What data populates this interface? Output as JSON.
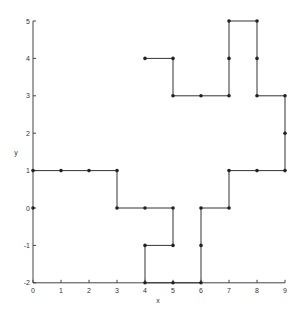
{
  "chart_data": {
    "type": "line",
    "title": "",
    "xlabel": "x",
    "ylabel": "y",
    "xlim": [
      0,
      9
    ],
    "ylim": [
      -2,
      5
    ],
    "grid": false,
    "legend": null,
    "x_ticks": [
      0,
      1,
      2,
      3,
      4,
      5,
      6,
      7,
      8,
      9
    ],
    "y_ticks": [
      -2,
      -1,
      0,
      1,
      2,
      3,
      4,
      5
    ],
    "series": [
      {
        "name": "path",
        "points": [
          [
            0,
            1
          ],
          [
            1,
            1
          ],
          [
            2,
            1
          ],
          [
            3,
            1
          ],
          [
            3,
            0
          ],
          [
            4,
            0
          ],
          [
            5,
            0
          ],
          [
            5,
            -1
          ],
          [
            4,
            -1
          ],
          [
            4,
            -2
          ],
          [
            5,
            -2
          ],
          [
            6,
            -2
          ],
          [
            6,
            -1
          ],
          [
            6,
            0
          ],
          [
            7,
            0
          ],
          [
            7,
            1
          ],
          [
            8,
            1
          ],
          [
            9,
            1
          ],
          [
            9,
            2
          ],
          [
            9,
            3
          ],
          [
            8,
            3
          ],
          [
            8,
            4
          ],
          [
            8,
            5
          ],
          [
            7,
            5
          ],
          [
            7,
            4
          ],
          [
            7,
            3
          ],
          [
            6,
            3
          ],
          [
            5,
            3
          ],
          [
            5,
            4
          ],
          [
            4,
            4
          ]
        ]
      },
      {
        "name": "isolated",
        "points": [
          [
            0,
            0
          ]
        ]
      }
    ],
    "style": {
      "line_color": "#333333",
      "marker_color": "#222222"
    }
  }
}
